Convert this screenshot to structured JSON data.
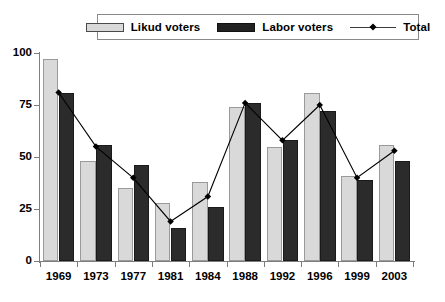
{
  "legend": {
    "entries": [
      {
        "label": "Likud voters",
        "icon": "light-gray-bar-swatch",
        "color": "#d9d9d9"
      },
      {
        "label": "Labor voters",
        "icon": "dark-bar-swatch",
        "color": "#222222"
      },
      {
        "label": "Total",
        "icon": "line-diamond-marker",
        "color": "#000000"
      }
    ]
  },
  "axes": {
    "y_ticks": [
      "0",
      "25",
      "50",
      "75",
      "100"
    ],
    "x_ticks": [
      "1969",
      "1973",
      "1977",
      "1981",
      "1984",
      "1988",
      "1992",
      "1996",
      "1999",
      "2003"
    ]
  },
  "chart_data": {
    "type": "bar",
    "title": "",
    "subtitle": "",
    "xlabel": "",
    "ylabel": "",
    "ylim": [
      0,
      100
    ],
    "yticks": [
      0,
      25,
      50,
      75,
      100
    ],
    "grid": false,
    "legend_position": "top-center",
    "categories": [
      "1969",
      "1973",
      "1977",
      "1981",
      "1984",
      "1988",
      "1992",
      "1996",
      "1999",
      "2003"
    ],
    "series": [
      {
        "name": "Likud voters",
        "type": "bar",
        "color": "#d9d9d9",
        "values": [
          97,
          48,
          35,
          28,
          38,
          74,
          55,
          81,
          41,
          56
        ]
      },
      {
        "name": "Labor voters",
        "type": "bar",
        "color": "#2b2b2b",
        "values": [
          81,
          56,
          46,
          16,
          26,
          76,
          58,
          72,
          39,
          48
        ]
      },
      {
        "name": "Total",
        "type": "line",
        "color": "#000000",
        "marker": "diamond",
        "values": [
          81,
          55,
          40,
          19,
          31,
          76,
          58,
          75,
          40,
          53
        ]
      }
    ]
  }
}
